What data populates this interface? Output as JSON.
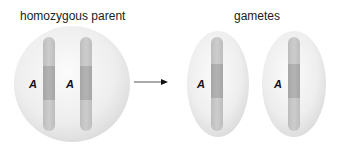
{
  "title_left": "homozygous parent",
  "title_right": "gametes",
  "parent": {
    "chromosomes": [
      {
        "allele": "A"
      },
      {
        "allele": "A"
      }
    ]
  },
  "gametes": [
    {
      "allele": "A"
    },
    {
      "allele": "A"
    }
  ],
  "arrow": "right-arrow",
  "colors": {
    "cell_fill": "#e9e9e9",
    "cell_edge": "#d6d6d6",
    "chromosome": "#c4c4c4",
    "chromosome_band": "#ababab",
    "text": "#222222"
  }
}
